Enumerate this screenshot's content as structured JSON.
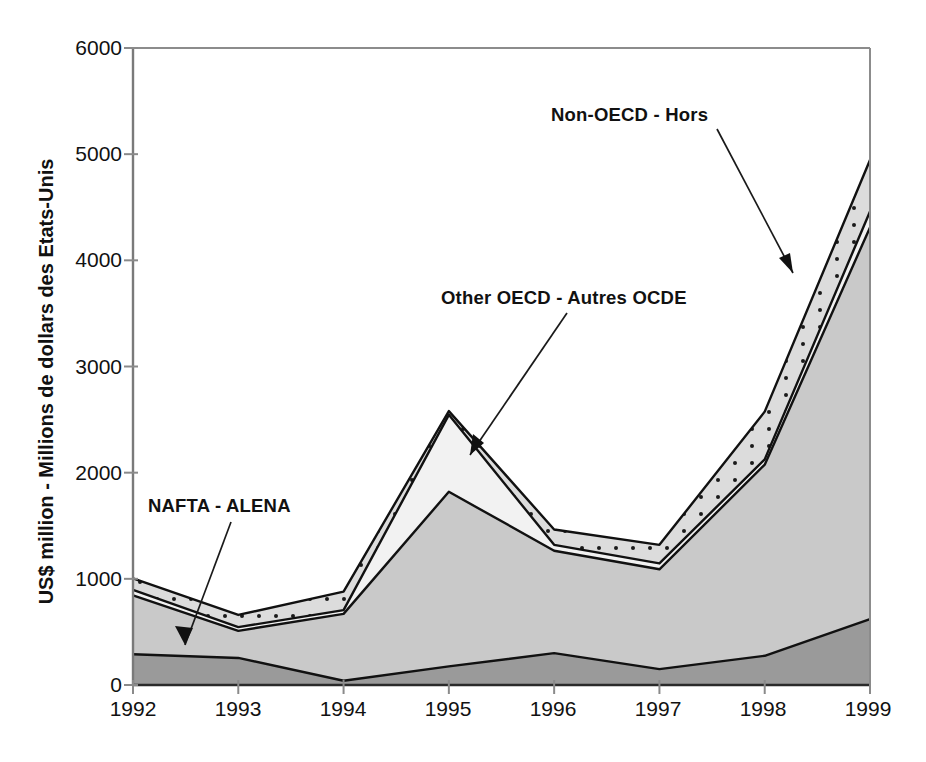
{
  "chart_data": {
    "type": "area",
    "stacked": true,
    "title": "",
    "xlabel": "",
    "ylabel": "US$ million - Millions de dollars des Etats-Unis",
    "categories": [
      "1992",
      "1993",
      "1994",
      "1995",
      "1996",
      "1997",
      "1998",
      "1999"
    ],
    "x": [
      1992,
      1993,
      1994,
      1995,
      1996,
      1997,
      1998,
      1999
    ],
    "ylim": [
      0,
      6000
    ],
    "yticks": [
      0,
      1000,
      2000,
      3000,
      4000,
      5000,
      6000
    ],
    "ytick_labels": [
      "0",
      "1000",
      "2000",
      "3000",
      "4000",
      "5000",
      "6000"
    ],
    "grid": false,
    "legend_position": "inline-annotations",
    "series": [
      {
        "name": "NAFTA - ALENA",
        "fill": "#9a9a9a",
        "pattern": "solid",
        "values": [
          290,
          255,
          40,
          175,
          300,
          150,
          275,
          620
        ]
      },
      {
        "name": "EU15 - UE15",
        "fill": "#c9c9c9",
        "pattern": "solid",
        "values": [
          555,
          255,
          630,
          1645,
          965,
          940,
          1800,
          3690
        ]
      },
      {
        "name": "Other OECD - Autres OCDE",
        "fill": "#f2f2f2",
        "pattern": "light",
        "values": [
          50,
          35,
          35,
          725,
          55,
          55,
          50,
          150
        ]
      },
      {
        "name": "Non-OECD - Hors",
        "fill": "#d6d6d6",
        "pattern": "dotted",
        "values": [
          110,
          115,
          175,
          35,
          145,
          175,
          450,
          485
        ]
      }
    ],
    "cumulative_tops": {
      "NAFTA - ALENA": [
        290,
        255,
        40,
        175,
        300,
        150,
        275,
        620
      ],
      "EU15 - UE15": [
        845,
        510,
        670,
        1820,
        1265,
        1090,
        2075,
        4310
      ],
      "Other OECD - Autres OCDE": [
        895,
        545,
        705,
        2545,
        1320,
        1145,
        2125,
        4460
      ],
      "Non-OECD - Hors": [
        1005,
        660,
        880,
        2580,
        1465,
        1320,
        2575,
        4945
      ]
    },
    "annotations": [
      {
        "label": "Non-OECD - Hors",
        "target_year": 1998,
        "target_value": 3950
      },
      {
        "label": "Other OECD - Autres OCDE",
        "target_year": 1995,
        "target_value": 2150
      },
      {
        "label": "NAFTA - ALENA",
        "target_year": 1992.6,
        "target_value": 275
      },
      {
        "label": "EU15 - UE15",
        "target_year": 1995.1,
        "target_value": 1000,
        "inline": true
      }
    ]
  },
  "axis": {
    "y_title": "US$ million - Millions de dollars des Etats-Unis",
    "y_ticks": [
      "6000",
      "5000",
      "4000",
      "3000",
      "2000",
      "1000",
      "0"
    ],
    "x_ticks": [
      "1992",
      "1993",
      "1994",
      "1995",
      "1996",
      "1997",
      "1998",
      "1999"
    ]
  },
  "annotations": {
    "non_oecd": "Non-OECD - Hors",
    "other_oecd": "Other OECD - Autres OCDE",
    "nafta": "NAFTA - ALENA",
    "eu15": "EU15 - UE15"
  },
  "colors": {
    "nafta": "#9a9a9a",
    "eu15": "#c9c9c9",
    "other_oecd": "#f4f4f4",
    "non_oecd": "#d6d6d6",
    "axis": "#6e6e6e",
    "line": "#111111",
    "text": "#111111"
  }
}
